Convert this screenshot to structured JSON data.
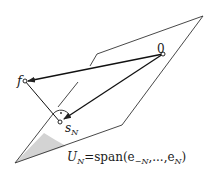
{
  "diagram": {
    "labels": {
      "origin": "0",
      "f": "f",
      "s_N_main": "s",
      "s_N_sub": "N",
      "subspace_U": "U",
      "subspace_U_sub": "N",
      "subspace_eq": "=span(e",
      "subspace_sub1": "−N",
      "subspace_mid": ",...,e",
      "subspace_sub2": "N",
      "subspace_end": ")"
    },
    "points": {
      "origin": [
        163,
        54
      ],
      "f": [
        25,
        81
      ],
      "s_N": [
        60,
        122
      ]
    },
    "plane": {
      "outline": [
        [
          15,
          163
        ],
        [
          122,
          125
        ],
        [
          203,
          16
        ],
        [
          97,
          54
        ],
        [
          90,
          66
        ]
      ],
      "shade_color": "#d0d0d0"
    },
    "colors": {
      "line": "#222222",
      "background": "#ffffff"
    }
  }
}
